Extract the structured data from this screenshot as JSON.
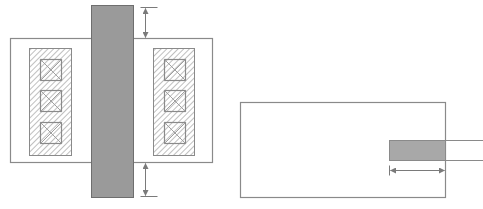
{
  "diagram": {
    "colors": {
      "background": "#ffffff",
      "outline": "#8a8a8a",
      "gate_fill": "#9a9a9a",
      "gate_stroke": "#6e6e6e",
      "hatch": "#9c9c9c",
      "dimension": "#7a7a7a",
      "small_gray_fill": "#a8a8a8"
    },
    "left_figure": {
      "name": "transistor-layout",
      "active_region": {
        "x": 10,
        "y": 38,
        "w": 202,
        "h": 124
      },
      "gate": {
        "x": 91,
        "y": 5,
        "w": 42,
        "h": 192
      },
      "source_diffusion": {
        "x": 29,
        "y": 48,
        "w": 42,
        "h": 107
      },
      "drain_diffusion": {
        "x": 153,
        "y": 48,
        "w": 41,
        "h": 107
      },
      "contacts_left": [
        {
          "x": 40,
          "y": 59,
          "w": 21,
          "h": 21
        },
        {
          "x": 40,
          "y": 90,
          "w": 21,
          "h": 21
        },
        {
          "x": 40,
          "y": 122,
          "w": 21,
          "h": 21
        }
      ],
      "contacts_right": [
        {
          "x": 164,
          "y": 59,
          "w": 21,
          "h": 21
        },
        {
          "x": 164,
          "y": 90,
          "w": 21,
          "h": 21
        },
        {
          "x": 164,
          "y": 122,
          "w": 21,
          "h": 21
        }
      ],
      "top_dimension": {
        "x": 145,
        "y1": 7,
        "y2": 38,
        "ext_x1": 133,
        "ext_x2": 157
      },
      "bottom_dimension": {
        "x": 145,
        "y1": 162,
        "y2": 196,
        "ext_x1": 133,
        "ext_x2": 157
      }
    },
    "right_figure": {
      "name": "poly-extension-view",
      "outer_region": {
        "x": 240,
        "y": 102,
        "w": 205,
        "h": 95
      },
      "gray_bar": {
        "x": 389,
        "y": 140,
        "w": 56,
        "h": 20
      },
      "extension_lines": [
        {
          "y": 140,
          "x1": 445,
          "x2": 483
        },
        {
          "y": 160,
          "x1": 445,
          "x2": 483
        }
      ],
      "dimension": {
        "y": 170,
        "x1": 389,
        "x2": 444
      }
    }
  }
}
